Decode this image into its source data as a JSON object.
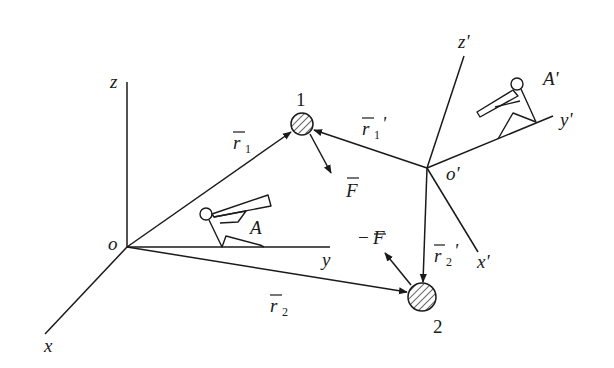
{
  "diagram": {
    "frames": {
      "inertial": {
        "origin_label": "o",
        "axes": {
          "x": "x",
          "y": "y",
          "z": "z"
        },
        "observer": "A"
      },
      "moving": {
        "origin_label": "o'",
        "axes": {
          "x": "x'",
          "y": "y'",
          "z": "z'"
        },
        "observer": "A'"
      }
    },
    "particles": [
      {
        "id": "1",
        "label": "1",
        "force": "F"
      },
      {
        "id": "2",
        "label": "2",
        "force": "−F"
      }
    ],
    "vectors": {
      "r1": {
        "base": "r",
        "sub": "1",
        "prime": ""
      },
      "r2": {
        "base": "r",
        "sub": "2",
        "prime": ""
      },
      "r1p": {
        "base": "r",
        "sub": "1",
        "prime": "'"
      },
      "r2p": {
        "base": "r",
        "sub": "2",
        "prime": "'"
      },
      "F": {
        "base": "F"
      },
      "negF": {
        "sign": "−",
        "base": "F"
      }
    },
    "colors": {
      "ink": "#1a1a1a",
      "background": "#ffffff"
    }
  }
}
